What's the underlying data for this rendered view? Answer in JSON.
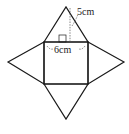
{
  "diagram": {
    "labels": {
      "slant_height": "5cm",
      "base_side": "6cm"
    },
    "colors": {
      "stroke": "#1a1a1a",
      "dash": "#555555"
    }
  }
}
